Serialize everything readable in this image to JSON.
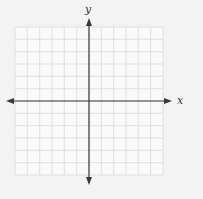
{
  "diagram": {
    "type": "coordinate-plane",
    "x_axis_label": "x",
    "y_axis_label": "y",
    "grid": {
      "columns": 12,
      "rows": 12,
      "left": 15,
      "top": 27,
      "right": 163,
      "bottom": 175,
      "origin_x": 89,
      "origin_y": 101
    },
    "x_axis": {
      "from": 6,
      "to": 172,
      "y": 101
    },
    "y_axis": {
      "from": 18,
      "to": 185,
      "x": 89
    },
    "colors": {
      "background": "#f3f3f3",
      "grid_fill": "#fafafa",
      "grid_line": "#d9d9d9",
      "axis": "#3a3a3a",
      "label": "#333333"
    }
  }
}
